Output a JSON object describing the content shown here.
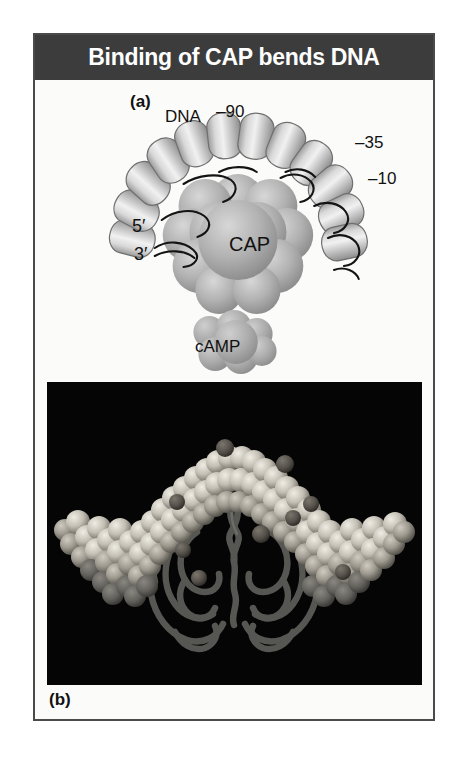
{
  "figure": {
    "title": "Binding of CAP bends DNA",
    "title_bar_color": "#3c3c3c",
    "title_text_color": "#ffffff",
    "frame_border_color": "#4a4a4a",
    "background_color": "#fbfbfa"
  },
  "panel_a": {
    "panel_label": "(a)",
    "type": "schematic-diagram",
    "labels": {
      "dna": "DNA",
      "position_90": "–90",
      "position_35": "–35",
      "position_10": "–10",
      "five_prime": "5′",
      "three_prime": "3′",
      "cap": "CAP",
      "camp": "cAMP"
    },
    "colors": {
      "dna_cylinder_light": "#e6e6e6",
      "dna_cylinder_mid": "#b4b4b4",
      "dna_cylinder_dark": "#8a8a8a",
      "dna_outline": "#6f6f6f",
      "backbone_trace": "#111111",
      "cap_protein_light": "#c9c9c9",
      "cap_protein_dark": "#8f8f8f",
      "camp_light": "#c4c4c4",
      "camp_dark": "#9a9a9a"
    }
  },
  "panel_b": {
    "panel_label": "(b)",
    "type": "photograph",
    "description": "space-filling model of bent DNA over CAP dimer ribbon",
    "colors": {
      "background": "#050505",
      "dna_spheres_light": "#d8d4cb",
      "dna_spheres_mid": "#a9a59b",
      "dna_spheres_shadow": "#6e6a62",
      "marker_spheres": "#56544f",
      "protein_ribbon": "#5a5a58",
      "protein_ribbon_light": "#6f6f6c"
    }
  }
}
